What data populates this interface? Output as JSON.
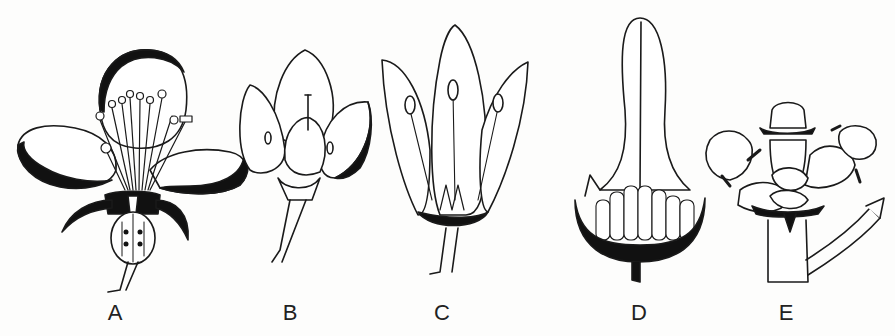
{
  "figure": {
    "type": "botanical illustration",
    "panels": [
      {
        "id": "A",
        "label": "A",
        "x": 115
      },
      {
        "id": "B",
        "label": "B",
        "x": 290
      },
      {
        "id": "C",
        "label": "C",
        "x": 442
      },
      {
        "id": "D",
        "label": "D",
        "x": 639
      },
      {
        "id": "E",
        "label": "E",
        "x": 786
      }
    ],
    "colors": {
      "ink": "#1a1a1a",
      "paper": "#fdfdfc"
    }
  }
}
